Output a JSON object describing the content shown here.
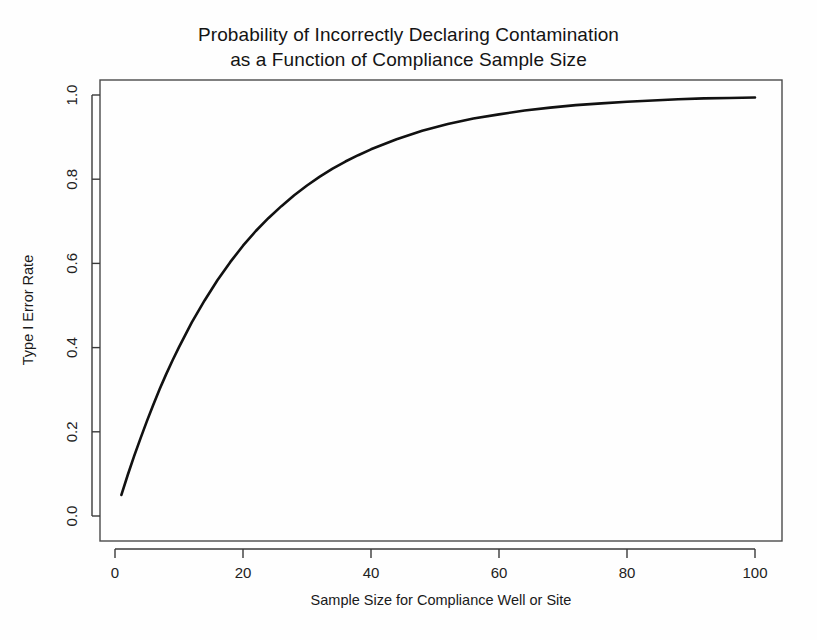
{
  "chart_data": {
    "type": "line",
    "title": "Probability of Incorrectly Declaring Contamination as a Function of Compliance Sample Size",
    "title_lines": [
      "Probability of Incorrectly Declaring Contamination",
      "as a Function of Compliance Sample Size"
    ],
    "xlabel": "Sample Size for Compliance Well or Site",
    "ylabel": "Type I Error Rate",
    "xlim": [
      0,
      104
    ],
    "ylim": [
      0.0,
      1.04
    ],
    "xticks": [
      0,
      20,
      40,
      60,
      80,
      100
    ],
    "xtick_labels": [
      "0",
      "20",
      "40",
      "60",
      "80",
      "100"
    ],
    "yticks": [
      0.0,
      0.2,
      0.4,
      0.6,
      0.8,
      1.0
    ],
    "ytick_labels": [
      "0.0",
      "0.2",
      "0.4",
      "0.6",
      "0.8",
      "1.0"
    ],
    "grid": false,
    "legend": false,
    "line_color": "#111111",
    "line_width": 2.6,
    "series": [
      {
        "name": "Type I Error Rate",
        "formula": "1 - (1 - 0.05)^n",
        "x": [
          1,
          2,
          3,
          4,
          5,
          6,
          7,
          8,
          9,
          10,
          12,
          14,
          16,
          18,
          20,
          22,
          24,
          26,
          28,
          30,
          32,
          34,
          36,
          38,
          40,
          44,
          48,
          52,
          56,
          60,
          64,
          68,
          72,
          76,
          80,
          84,
          88,
          92,
          96,
          100
        ],
        "values": [
          0.05,
          0.098,
          0.143,
          0.185,
          0.226,
          0.265,
          0.302,
          0.337,
          0.37,
          0.401,
          0.46,
          0.512,
          0.56,
          0.603,
          0.642,
          0.677,
          0.708,
          0.736,
          0.762,
          0.785,
          0.806,
          0.825,
          0.842,
          0.857,
          0.871,
          0.895,
          0.915,
          0.931,
          0.944,
          0.954,
          0.963,
          0.97,
          0.976,
          0.98,
          0.984,
          0.987,
          0.99,
          0.992,
          0.993,
          0.994
        ]
      }
    ]
  },
  "figure": {
    "background_color": "#fefefe",
    "frame_color": "#4a4a4a",
    "text_color": "#1a1a1a"
  }
}
